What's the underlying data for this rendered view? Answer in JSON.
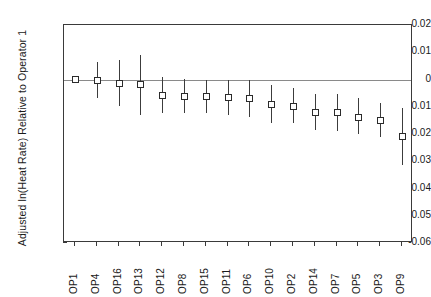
{
  "chart_data": {
    "type": "scatter",
    "title": "",
    "xlabel": "",
    "ylabel": "Adjusted ln(Heat Rate) Relative to Operator 1",
    "ylim": [
      -0.06,
      0.02
    ],
    "yticks": [
      0.02,
      0.01,
      0,
      -0.01,
      -0.02,
      -0.03,
      -0.04,
      -0.05,
      -0.06
    ],
    "ytick_labels": [
      "0.02",
      "0.01",
      "0",
      "-0.01",
      "-0.02",
      "-0.03",
      "-0.04",
      "-0.05",
      "-0.06"
    ],
    "grid": false,
    "legend": "none",
    "reference_line": 0,
    "categories": [
      "OP1",
      "OP4",
      "OP16",
      "OP13",
      "OP12",
      "OP8",
      "OP15",
      "OP11",
      "OP6",
      "OP10",
      "OP2",
      "OP14",
      "OP7",
      "OP5",
      "OP3",
      "OP9"
    ],
    "values": [
      0.0,
      -0.0002,
      -0.0016,
      -0.002,
      -0.0057,
      -0.0064,
      -0.0063,
      -0.0066,
      -0.0071,
      -0.009,
      -0.0098,
      -0.012,
      -0.0122,
      -0.0138,
      -0.0152,
      -0.021
    ],
    "error_low": [
      0.0,
      -0.0067,
      -0.0097,
      -0.013,
      -0.0122,
      -0.0123,
      -0.0122,
      -0.0129,
      -0.0139,
      -0.0158,
      -0.016,
      -0.0185,
      -0.019,
      -0.02,
      -0.0212,
      -0.0315
    ],
    "error_high": [
      0.0,
      0.0065,
      0.007,
      0.009,
      0.0011,
      0.0002,
      0.0,
      -0.0002,
      -0.0002,
      -0.0021,
      -0.003,
      -0.0052,
      -0.0054,
      -0.0068,
      -0.0088,
      -0.0105
    ],
    "marker": "open-square",
    "series_name": "Adjusted ln(Heat Rate) by Operator"
  }
}
